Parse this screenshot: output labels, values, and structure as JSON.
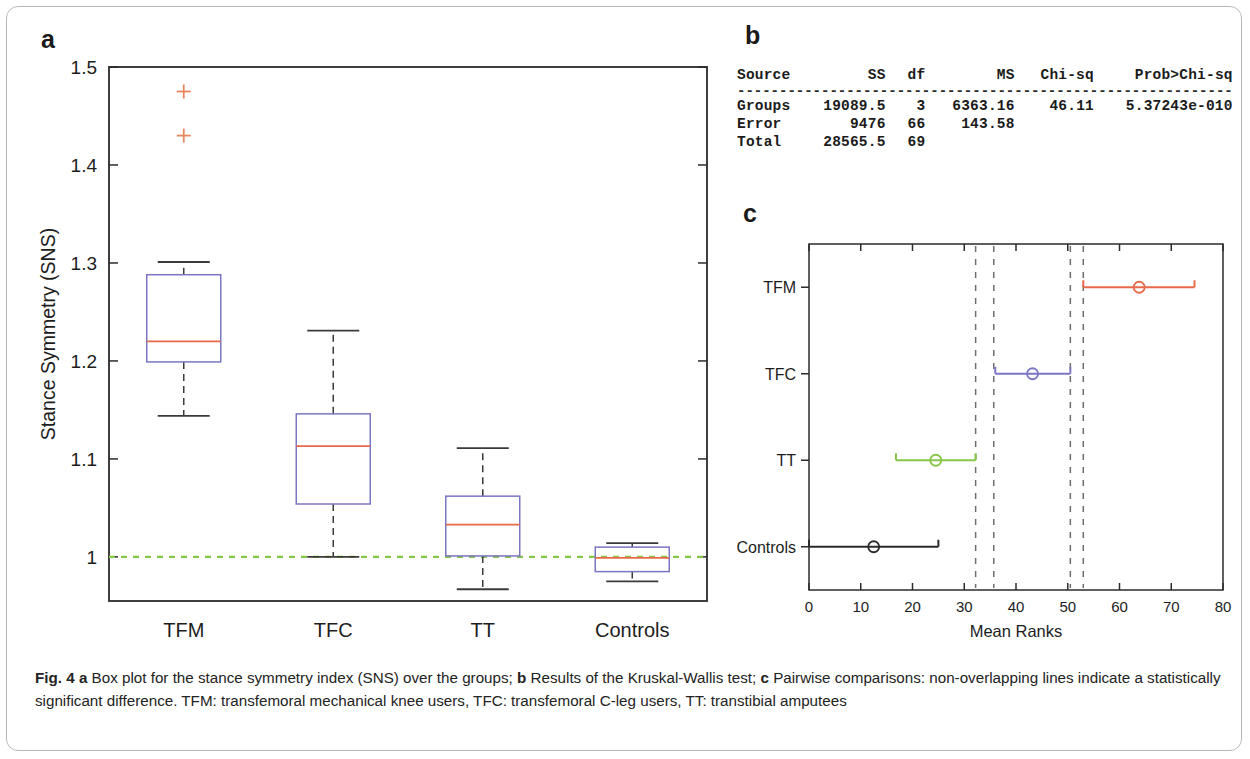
{
  "figure": {
    "panel_a_letter": "a",
    "panel_b_letter": "b",
    "panel_c_letter": "c",
    "caption_prefix": "Fig. 4",
    "caption_a_letter": "a",
    "caption_a_text": "Box plot for the stance symmetry index (SNS) over the groups;",
    "caption_b_letter": "b",
    "caption_b_text": "Results of the Kruskal-Wallis test;",
    "caption_c_letter": "c",
    "caption_c_text": "Pairwise comparisons: non-overlapping lines indicate a statistically significant difference. TFM: transfemoral mechanical knee users, TFC: transfemoral C-leg users, TT: transtibial amputees"
  },
  "colors": {
    "box_edge": "#7b76c4",
    "median": "#e8694a",
    "outlier": "#e8855f",
    "reference_line": "#86c646",
    "whisker": "#3a3a3a",
    "axis": "#2b2b2b",
    "series_tfm": "#e8694a",
    "series_tfc": "#7b76c4",
    "series_tfc_right": "#c9a8d8",
    "series_tt": "#86c646",
    "series_controls": "#2b2b2b",
    "dashed_vertical": "#6e6e6e"
  },
  "stats_table": {
    "headers": [
      "Source",
      "SS",
      "df",
      "MS",
      "Chi-sq",
      "Prob>Chi-sq"
    ],
    "separator": "-----------------------------------------------------------",
    "rows": [
      [
        "Groups",
        "19089.5",
        "3",
        "6363.16",
        "46.11",
        "5.37243e-010"
      ],
      [
        "Error",
        "9476",
        "66",
        "143.58",
        "",
        ""
      ],
      [
        "Total",
        "28565.5",
        "69",
        "",
        "",
        ""
      ]
    ]
  },
  "chart_data": [
    {
      "type": "box",
      "panel": "a",
      "title": "",
      "xlabel": "",
      "ylabel": "Stance Symmetry (SNS)",
      "categories": [
        "TFM",
        "TFC",
        "TT",
        "Controls"
      ],
      "ylim": [
        0.955,
        1.5
      ],
      "yticks": [
        1,
        1.1,
        1.2,
        1.3,
        1.4,
        1.5
      ],
      "yticklabels": [
        "1",
        "1.1",
        "1.2",
        "1.3",
        "1.4",
        "1.5"
      ],
      "grid": false,
      "reference_line": {
        "value": 1.0,
        "style": "dashed",
        "color": "#86c646"
      },
      "boxes": [
        {
          "category": "TFM",
          "whisker_low": 1.144,
          "q1": 1.199,
          "median": 1.22,
          "q3": 1.288,
          "whisker_high": 1.301,
          "outliers": [
            1.43,
            1.475
          ]
        },
        {
          "category": "TFC",
          "whisker_low": 1.0,
          "q1": 1.054,
          "median": 1.113,
          "q3": 1.146,
          "whisker_high": 1.231,
          "outliers": []
        },
        {
          "category": "TT",
          "whisker_low": 0.967,
          "q1": 1.001,
          "median": 1.033,
          "q3": 1.062,
          "whisker_high": 1.111,
          "outliers": []
        },
        {
          "category": "Controls",
          "whisker_low": 0.975,
          "q1": 0.985,
          "median": 0.999,
          "q3": 1.01,
          "whisker_high": 1.014,
          "outliers": []
        }
      ]
    },
    {
      "type": "interval",
      "panel": "c",
      "title": "",
      "xlabel": "Mean Ranks",
      "ylabel": "",
      "categories": [
        "TFM",
        "TFC",
        "TT",
        "Controls"
      ],
      "xlim": [
        0,
        80
      ],
      "xticks": [
        0,
        10,
        20,
        30,
        40,
        50,
        60,
        70,
        80
      ],
      "xticklabels": [
        "0",
        "10",
        "20",
        "30",
        "40",
        "50",
        "60",
        "70",
        "80"
      ],
      "grid": false,
      "intervals": [
        {
          "category": "TFM",
          "low": 53.0,
          "mean": 63.8,
          "high": 74.5,
          "color": "#e8694a"
        },
        {
          "category": "TFC",
          "low": 36.0,
          "mean": 43.2,
          "high": 50.5,
          "color": "#7b76c4"
        },
        {
          "category": "TT",
          "low": 16.8,
          "mean": 24.5,
          "high": 32.2,
          "color": "#86c646"
        },
        {
          "category": "Controls",
          "low": 0.0,
          "mean": 12.5,
          "high": 25.0,
          "color": "#2b2b2b"
        }
      ],
      "dashed_verticals": [
        32.2,
        35.7,
        50.5,
        53.0
      ]
    }
  ]
}
